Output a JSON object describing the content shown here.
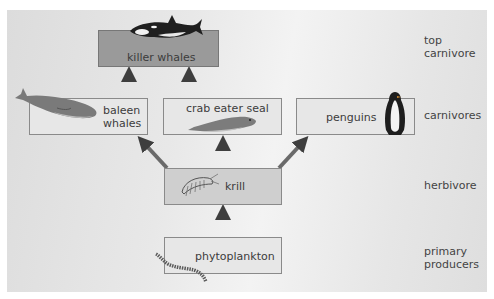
{
  "nodes": {
    "killer_whales": {
      "label": "killer whales",
      "icon": "orca-icon"
    },
    "baleen_whales": {
      "label_line1": "baleen",
      "label_line2": "whales",
      "icon": "whale-icon"
    },
    "crab_eater_seal": {
      "label": "crab eater seal",
      "icon": "seal-icon"
    },
    "penguins": {
      "label": "penguins",
      "icon": "penguin-icon"
    },
    "krill": {
      "label": "krill",
      "icon": "krill-icon"
    },
    "phytoplankton": {
      "label": "phytoplankton",
      "icon": "phytoplankton-icon"
    }
  },
  "levels": {
    "top_carnivore": {
      "line1": "top",
      "line2": "carnivore"
    },
    "carnivores": {
      "label": "carnivores"
    },
    "herbivore": {
      "label": "herbivore"
    },
    "primary_producers": {
      "line1": "primary",
      "line2": "producers"
    }
  },
  "edges": [
    {
      "from": "phytoplankton",
      "to": "krill"
    },
    {
      "from": "krill",
      "to": "baleen_whales"
    },
    {
      "from": "krill",
      "to": "crab_eater_seal"
    },
    {
      "from": "krill",
      "to": "penguins"
    },
    {
      "from": "baleen_whales",
      "to": "killer_whales"
    },
    {
      "from": "crab_eater_seal",
      "to": "killer_whales"
    }
  ],
  "colors": {
    "top_box": "#9a9a9a",
    "mid_box": "#cfcfcf",
    "light_box": "#e7e7e7",
    "arrow": "#5a5a5a"
  }
}
